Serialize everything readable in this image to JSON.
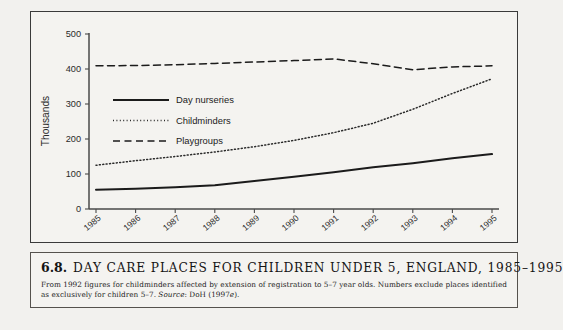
{
  "chart_data": {
    "type": "line",
    "xlabel": "",
    "ylabel": "Thousands",
    "categories": [
      "1985",
      "1986",
      "1987",
      "1988",
      "1989",
      "1990",
      "1991",
      "1992",
      "1993",
      "1994",
      "1995"
    ],
    "x": [
      1985,
      1986,
      1987,
      1988,
      1989,
      1990,
      1991,
      1992,
      1993,
      1994,
      1995
    ],
    "ylim": [
      0,
      500
    ],
    "yticks": [
      0,
      100,
      200,
      300,
      400,
      500
    ],
    "grid": false,
    "legend_position": "upper-left-inside",
    "series": [
      {
        "name": "Day nurseries",
        "style": "solid",
        "color": "#1b1b1b",
        "values": [
          55,
          58,
          62,
          68,
          80,
          92,
          105,
          119,
          131,
          145,
          157
        ]
      },
      {
        "name": "Childminders",
        "style": "dotted",
        "color": "#2a2a2a",
        "values": [
          125,
          138,
          150,
          163,
          178,
          196,
          218,
          245,
          285,
          330,
          372
        ]
      },
      {
        "name": "Playgroups",
        "style": "dashed",
        "color": "#1b1b1b",
        "values": [
          409,
          410,
          412,
          416,
          420,
          424,
          429,
          415,
          398,
          406,
          409
        ]
      }
    ]
  },
  "caption": {
    "number": "6.8.",
    "title": "DAY CARE PLACES FOR CHILDREN UNDER 5, ENGLAND, 1985–1995",
    "note_part1": "From 1992 figures for childminders affected by extension of registration to 5–7 year olds. Numbers exclude places identified as exclusively for children 5–7. ",
    "note_source_label": "Source",
    "note_part2": ": DoH (1997",
    "note_suffix_italic": "e",
    "note_part3": ")."
  }
}
